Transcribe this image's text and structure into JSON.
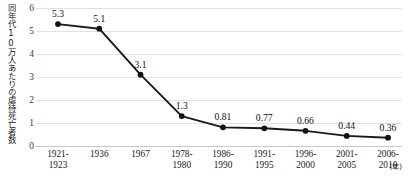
{
  "chart_data": {
    "type": "line",
    "title": "",
    "subtitle": "",
    "xlabel": "",
    "ylabel": "同年代10万人あたりの虐待死亡者数",
    "categories": [
      "1921-1923",
      "1936",
      "1967",
      "1978-1980",
      "1986-1990",
      "1991-1995",
      "1996-2000",
      "2001-2005",
      "2006-2010"
    ],
    "category_lines": [
      [
        "1921-",
        "1923"
      ],
      [
        "1936",
        ""
      ],
      [
        "1967",
        ""
      ],
      [
        "1978-",
        "1980"
      ],
      [
        "1986-",
        "1990"
      ],
      [
        "1991-",
        "1995"
      ],
      [
        "1996-",
        "2000"
      ],
      [
        "2001-",
        "2005"
      ],
      [
        "2006-",
        "2010"
      ]
    ],
    "values": [
      5.3,
      5.1,
      3.1,
      1.3,
      0.81,
      0.77,
      0.66,
      0.44,
      0.36
    ],
    "value_labels": [
      "5.3",
      "5.1",
      "3.1",
      "1.3",
      "0.81",
      "0.77",
      "0.66",
      "0.44",
      "0.36"
    ],
    "ylim": [
      0,
      6
    ],
    "y_ticks": [
      6,
      5,
      4,
      3,
      2,
      1,
      0
    ],
    "y_tick_labels": [
      "6",
      "5",
      "4",
      "3",
      "2",
      "1",
      "0"
    ],
    "grid": true,
    "legend": false,
    "x_axis_unit_note": "(年)",
    "colors": {
      "line": "#1a1a1a",
      "marker": "#111111",
      "gridline": "#e2e2e2",
      "axis": "#c9c9c9",
      "text": "#1a1a1a",
      "background": "#ffffff"
    }
  }
}
